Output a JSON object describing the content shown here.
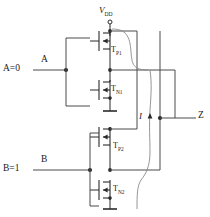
{
  "figure": {
    "type": "cmos-logic-circuit-schematic",
    "supply": {
      "label": "V",
      "subscript": "DD"
    },
    "inputs": [
      {
        "name": "A",
        "state_label": "A=0",
        "pin_label": "A",
        "value": 0
      },
      {
        "name": "B",
        "state_label": "B=1",
        "pin_label": "B",
        "value": 1
      }
    ],
    "output": {
      "pin_label": "Z"
    },
    "current": {
      "label": "I"
    },
    "devices": [
      {
        "id": "TP1",
        "base": "T",
        "sub": "P1",
        "type": "pmos"
      },
      {
        "id": "TN1",
        "base": "T",
        "sub": "N1",
        "type": "nmos"
      },
      {
        "id": "TP2",
        "base": "T",
        "sub": "P2",
        "type": "pmos"
      },
      {
        "id": "TN2",
        "base": "T",
        "sub": "N2",
        "type": "nmos"
      }
    ],
    "colors": {
      "wire": "#4a4a4a",
      "device": "#2b2b2b",
      "text": "#1a1a1a",
      "background": "#ffffff"
    }
  }
}
